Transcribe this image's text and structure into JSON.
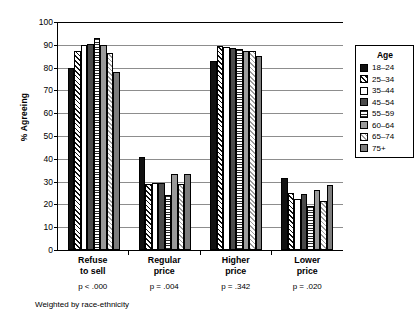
{
  "chart_data": {
    "type": "bar",
    "title": "",
    "subtitle": "",
    "xlabel": "",
    "ylabel": "% Agreeing",
    "ylim": [
      0,
      100
    ],
    "ytick_step": 10,
    "yticks": [
      100,
      90,
      80,
      70,
      60,
      50,
      40,
      30,
      20,
      10,
      0
    ],
    "grid": true,
    "grid_axis": "y",
    "legend_position": "right",
    "legend_title": "Age",
    "categories": [
      "Refuse to sell",
      "Regular price",
      "Higher price",
      "Lower price"
    ],
    "category_lines": [
      [
        "Refuse",
        "to sell"
      ],
      [
        "Regular",
        "price"
      ],
      [
        "Higher",
        "price"
      ],
      [
        "Lower",
        "price"
      ]
    ],
    "annotations": [
      "p < .000",
      "p = .004",
      "p = .342",
      "p = .020"
    ],
    "footnote": "Weighted by race-ethnicity",
    "series": [
      {
        "name": "18–24",
        "pattern": "solid-black",
        "values": [
          80.0,
          41.0,
          83.0,
          31.5
        ]
      },
      {
        "name": "25–34",
        "pattern": "diagonal-hatch",
        "values": [
          87.5,
          29.0,
          89.5,
          25.0
        ]
      },
      {
        "name": "35–44",
        "pattern": "white",
        "values": [
          90.0,
          29.5,
          89.0,
          22.5
        ]
      },
      {
        "name": "45–54",
        "pattern": "dark-gray",
        "values": [
          90.5,
          29.5,
          88.5,
          24.5
        ]
      },
      {
        "name": "55–59",
        "pattern": "horizontal-lines",
        "values": [
          93.0,
          24.0,
          88.0,
          19.5
        ]
      },
      {
        "name": "60–64",
        "pattern": "medium-gray",
        "values": [
          90.0,
          33.5,
          87.5,
          26.5
        ]
      },
      {
        "name": "65–74",
        "pattern": "dotted",
        "values": [
          86.5,
          29.0,
          87.5,
          21.5
        ]
      },
      {
        "name": "75+",
        "pattern": "gray",
        "values": [
          78.0,
          33.5,
          85.0,
          28.5
        ]
      }
    ]
  }
}
